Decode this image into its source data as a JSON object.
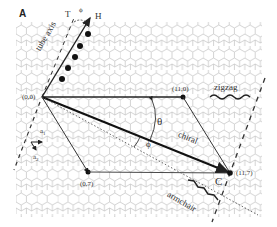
{
  "figure": {
    "panel_label": "A",
    "lattice": "graphene honeycomb",
    "points": {
      "origin": "(0,0)",
      "zigzag_end": "(11,0)",
      "armchair_side": "(0,7)",
      "chiral_end": "(11,7)"
    },
    "labels": {
      "tube_axis": "tube axis",
      "zigzag": "zigzag",
      "chiral": "chiral",
      "armchair": "armchair",
      "theta": "θ",
      "phi": "ϕ",
      "phi_top": "ϕ",
      "T": "T",
      "H": "H",
      "C": "C",
      "a1": "a",
      "a1_sub": "1",
      "a2": "a",
      "a2_sub": "2"
    },
    "colors": {
      "lattice": "#c8c8c8",
      "vector": "#333333",
      "text": "#333333"
    }
  }
}
